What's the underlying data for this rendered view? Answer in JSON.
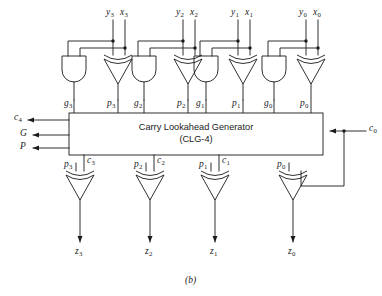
{
  "figure": {
    "caption": "(b)",
    "block": {
      "title_line1": "Carry Lookahead  Generator",
      "title_line2": "(CLG-4)"
    },
    "inputs_top": [
      {
        "y": "y",
        "y_sub": "3",
        "x": "x",
        "x_sub": "3"
      },
      {
        "y": "y",
        "y_sub": "2",
        "x": "x",
        "x_sub": "2"
      },
      {
        "y": "y",
        "y_sub": "1",
        "x": "x",
        "x_sub": "1"
      },
      {
        "y": "y",
        "y_sub": "0",
        "x": "x",
        "x_sub": "0"
      }
    ],
    "generate_labels": [
      {
        "name": "g",
        "sub": "3"
      },
      {
        "name": "g",
        "sub": "2"
      },
      {
        "name": "g",
        "sub": "1"
      },
      {
        "name": "g",
        "sub": "0"
      }
    ],
    "propagate_labels": [
      {
        "name": "p",
        "sub": "3"
      },
      {
        "name": "p",
        "sub": "2"
      },
      {
        "name": "p",
        "sub": "1"
      },
      {
        "name": "p",
        "sub": "0"
      }
    ],
    "propagate_labels_lower": [
      {
        "name": "p",
        "sub": "3"
      },
      {
        "name": "p",
        "sub": "2"
      },
      {
        "name": "p",
        "sub": "1"
      },
      {
        "name": "p",
        "sub": "0"
      }
    ],
    "carry_labels": [
      {
        "name": "c",
        "sub": "3"
      },
      {
        "name": "c",
        "sub": "2"
      },
      {
        "name": "c",
        "sub": "1"
      }
    ],
    "sum_outputs": [
      {
        "name": "z",
        "sub": "3"
      },
      {
        "name": "z",
        "sub": "2"
      },
      {
        "name": "z",
        "sub": "1"
      },
      {
        "name": "z",
        "sub": "0"
      }
    ],
    "left_outputs": [
      {
        "name": "c",
        "sub": "4"
      },
      {
        "name": "G",
        "sub": ""
      },
      {
        "name": "P",
        "sub": ""
      }
    ],
    "carry_in": {
      "name": "c",
      "sub": "0"
    },
    "colors": {
      "line": "#1a1a1a",
      "background": "#ffffff",
      "block_fill": "#ffffff"
    }
  }
}
